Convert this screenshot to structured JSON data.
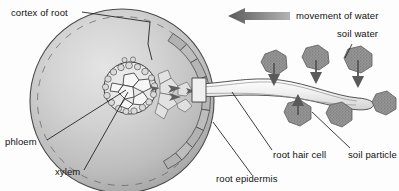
{
  "diagram": {
    "background_color": "#fdfdfd"
  },
  "labels": {
    "cortex_of_root": "cortex of root",
    "phloem": "phloem",
    "xylem": "xylem",
    "root_epidermis": "root epidermis",
    "root_hair_cell": "root hair cell",
    "soil_particle": "soil particle",
    "soil_water": "soil water",
    "movement_of_water": "movement of water"
  },
  "colors": {
    "root_fill_outer": "#a9a9a9",
    "root_fill_inner": "#d8d8d8",
    "outline": "#3a3a3a",
    "epidermis_fill": "#b9b9b9",
    "stele_cell_fill": "#f2f2f2",
    "soil_particle_fill": "#8e8e8e",
    "arrow_fill": "#707070",
    "label_text": "#111111",
    "root_hair_fill": "#efefef"
  },
  "elements": {
    "root_cross_section": "large circle showing root in transverse section",
    "stele": "central vascular bundle with xylem and phloem cells",
    "epidermis_ring": "outer ring of epidermal cells",
    "root_hair": "elongated root hair projecting into soil",
    "soil_particles_count": 6,
    "water_arrows_count": 4,
    "movement_arrow_direction": "left"
  }
}
